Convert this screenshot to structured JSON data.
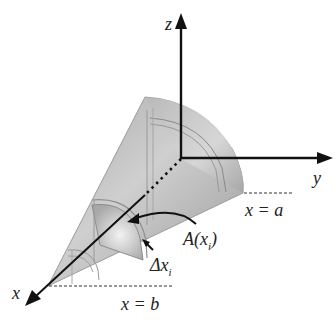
{
  "figure": {
    "axes": {
      "x_label": "x",
      "y_label": "y",
      "z_label": "z"
    },
    "bounds": {
      "a_label": "x = a",
      "b_label": "x = b"
    },
    "annotations": {
      "area_label_main": "A(x",
      "area_label_sub": "i",
      "area_label_close": ")",
      "delta_label_main": "Δx",
      "delta_label_sub": "i"
    },
    "colors": {
      "axis": "#111111",
      "solid_light": "#e6e6e6",
      "solid_mid": "#bdbdbd",
      "solid_dark": "#8f8f8f",
      "dashed": "#333333",
      "text": "#222222"
    }
  }
}
